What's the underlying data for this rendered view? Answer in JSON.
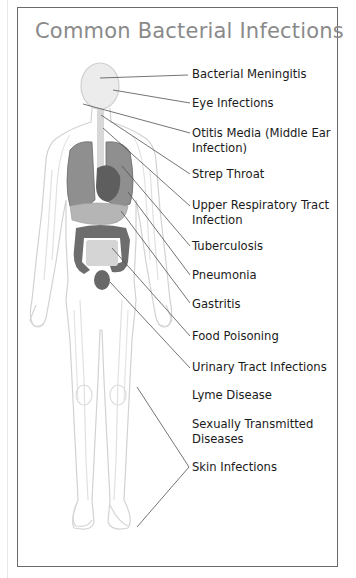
{
  "title": "Common Bacterial Infections",
  "labels": [
    {
      "text": "Bacterial Meningitis",
      "lines": [
        "Bacterial Meningitis"
      ]
    },
    {
      "text": "Eye Infections",
      "lines": [
        "Eye Infections"
      ]
    },
    {
      "text": "Otitis Media (Middle Ear Infection)",
      "lines": [
        "Otitis Media (Middle Ear",
        "Infection)"
      ]
    },
    {
      "text": "Strep Throat",
      "lines": [
        "Strep Throat"
      ]
    },
    {
      "text": "Upper Respiratory Tract Infection",
      "lines": [
        "Upper Respiratory Tract",
        "Infection"
      ]
    },
    {
      "text": "Tuberculosis",
      "lines": [
        "Tuberculosis"
      ]
    },
    {
      "text": "Pneumonia",
      "lines": [
        "Pneumonia"
      ]
    },
    {
      "text": "Gastritis",
      "lines": [
        "Gastritis"
      ]
    },
    {
      "text": "Food Poisoning",
      "lines": [
        "Food Poisoning"
      ]
    },
    {
      "text": "Urinary Tract Infections",
      "lines": [
        "Urinary Tract Infections"
      ]
    },
    {
      "text": "Lyme Disease",
      "lines": [
        "Lyme Disease"
      ]
    },
    {
      "text": "Sexually Transmitted Diseases",
      "lines": [
        "Sexually Transmitted",
        "Diseases"
      ]
    },
    {
      "text": "Skin Infections",
      "lines": [
        "Skin Infections"
      ]
    }
  ],
  "colors": {
    "title": "#8a8a8a",
    "label": "#1a1a1a",
    "leader_line": "#555555",
    "body_outline": "#cfcfcf",
    "organ_dark": "#6f6f6f",
    "organ_mid": "#8c8c8c",
    "organ_light": "#bdbdbd"
  }
}
